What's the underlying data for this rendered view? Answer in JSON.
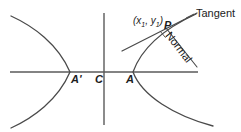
{
  "figure": {
    "stroke_color": "#4a4a4a",
    "label_color": "#1c1c1c",
    "background": "#ffffff",
    "width": 241,
    "height": 132
  },
  "labels": {
    "vertex_left": "A'",
    "center": "C",
    "vertex_right": "A",
    "point": "P",
    "coord_open": "(",
    "coord_x": "x",
    "coord_x_sub": "1",
    "coord_comma": ", ",
    "coord_y": "y",
    "coord_y_sub": "1",
    "coord_close": ")",
    "tangent": "Tangent",
    "normal": "Normal"
  },
  "geometry": {
    "x_axis": {
      "x1": 10,
      "y1": 72,
      "x2": 198,
      "y2": 72
    },
    "y_axis": {
      "x1": 104,
      "y1": 13,
      "x2": 104,
      "y2": 125
    },
    "left_branch": {
      "vertex": [
        70,
        72
      ],
      "upper_end": [
        11,
        16
      ],
      "lower_end": [
        11,
        128
      ]
    },
    "right_branch": {
      "vertex": [
        133,
        72
      ],
      "upper_end": [
        196,
        14
      ],
      "lower_end": [
        213,
        126
      ]
    },
    "tangent_line": {
      "x1": 122,
      "y1": 51,
      "x2": 196,
      "y2": 14
    },
    "normal_line": {
      "x1": 166,
      "y1": 28,
      "x2": 196,
      "y2": 66
    },
    "point_p": [
      166,
      28
    ],
    "right_angle_mark_size": 7
  }
}
